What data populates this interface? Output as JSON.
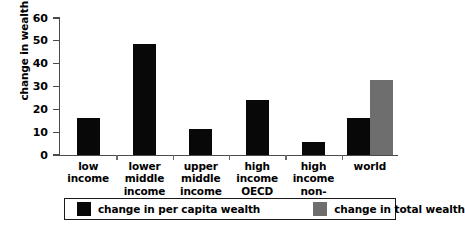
{
  "chart_data": {
    "type": "bar",
    "title": "",
    "xlabel": "",
    "ylabel": "change in wealth (%)",
    "ylim": [
      0,
      60
    ],
    "yticks": [
      0,
      10,
      20,
      30,
      40,
      50,
      60
    ],
    "grid": false,
    "legend_position": "bottom",
    "categories": [
      "low\nincome",
      "lower\nmiddle\nincome",
      "upper\nmiddle\nincome",
      "high\nincome\nOECD",
      "high\nincome\nnon-OECD",
      "world"
    ],
    "series": [
      {
        "name": "change in per capita wealth",
        "color": "#080808",
        "values": [
          16,
          48.5,
          11.5,
          24,
          5.5,
          16
        ]
      },
      {
        "name": "change in total wealth",
        "color": "#6e6e6e",
        "values": [
          null,
          null,
          null,
          null,
          null,
          33
        ]
      }
    ]
  },
  "legend": {
    "items": [
      {
        "label": "change in per capita wealth",
        "swatch": "black"
      },
      {
        "label": "change in total wealth",
        "swatch": "gray"
      }
    ]
  }
}
